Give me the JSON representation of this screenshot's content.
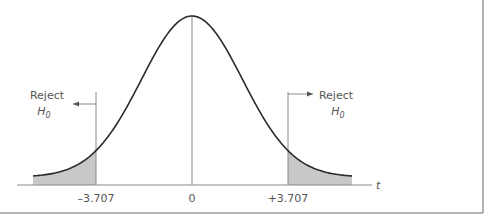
{
  "chart_data": {
    "type": "area",
    "distribution": "t",
    "title": "",
    "xlabel": "t",
    "ylabel": "",
    "center": 0,
    "critical_values": [
      -3.707,
      3.707
    ],
    "tick_labels": [
      "–3.707",
      "0",
      "+3.707"
    ],
    "tick_values": [
      -3.707,
      0,
      3.707
    ],
    "annotations": [
      {
        "text": "Reject",
        "subtext": "H",
        "subscript": "0",
        "side": "left",
        "arrow": "left"
      },
      {
        "text": "Reject",
        "subtext": "H",
        "subscript": "0",
        "side": "right",
        "arrow": "right"
      }
    ],
    "shaded_regions": [
      {
        "from": "-inf",
        "to": -3.707,
        "label": "left rejection region"
      },
      {
        "from": 3.707,
        "to": "inf",
        "label": "right rejection region"
      }
    ],
    "grid": false,
    "legend": "none",
    "colors": {
      "curve": "#2b2b2b",
      "shade": "#c8c8c8",
      "lines": "#8a8a8a",
      "border": "#9a9a9a"
    }
  }
}
